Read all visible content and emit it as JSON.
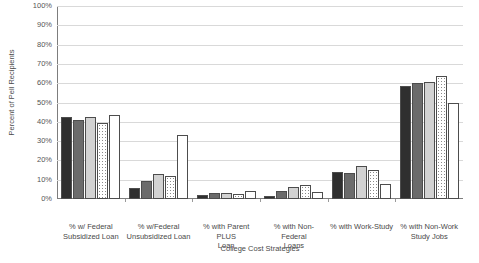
{
  "chart_data": {
    "type": "bar",
    "title": "",
    "xlabel": "College Cost Strategies",
    "ylabel": "Percent of Pell Recipients",
    "ylim": [
      0,
      100
    ],
    "ytick_labels": [
      "100%",
      "90%",
      "80%",
      "70%",
      "60%",
      "50%",
      "40%",
      "30%",
      "20%",
      "10%",
      "0%"
    ],
    "ytick_values": [
      100,
      90,
      80,
      70,
      60,
      50,
      40,
      30,
      20,
      10,
      0
    ],
    "grid": true,
    "legend": "none",
    "categories": [
      "% w/ Federal Subsidized Loan",
      "% w/Federal Unsubsidized Loan",
      "% with Parent PLUS Loan",
      "% with Non-Federal Loans",
      "% with Work-Study",
      "% with Non-Work Study Jobs"
    ],
    "category_lines": [
      [
        "% w/ Federal",
        "Subsidized Loan"
      ],
      [
        "% w/Federal",
        "Unsubsidized Loan"
      ],
      [
        "% with Parent PLUS",
        "Loan"
      ],
      [
        "% with Non-Federal",
        "Loans"
      ],
      [
        "% with Work-Study",
        ""
      ],
      [
        "% with Non-Work",
        "Study Jobs"
      ]
    ],
    "series": [
      {
        "name": "series-1",
        "fill": "black",
        "values": [
          42.5,
          5.5,
          2.0,
          1.5,
          14.0,
          58.5
        ]
      },
      {
        "name": "series-2",
        "fill": "dark-gray",
        "values": [
          41.0,
          9.5,
          3.0,
          4.0,
          13.5,
          60.0
        ]
      },
      {
        "name": "series-3",
        "fill": "light-gray",
        "values": [
          42.5,
          13.0,
          3.0,
          6.0,
          17.0,
          60.5
        ]
      },
      {
        "name": "series-4",
        "fill": "dotted",
        "values": [
          39.5,
          12.0,
          2.5,
          7.5,
          15.0,
          63.5
        ]
      },
      {
        "name": "series-5",
        "fill": "white",
        "values": [
          43.5,
          33.0,
          4.0,
          3.5,
          8.0,
          50.0
        ]
      }
    ]
  }
}
